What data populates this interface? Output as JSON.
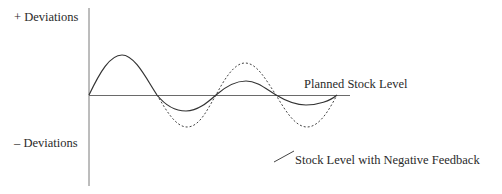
{
  "diagram": {
    "y_axis": {
      "top_label": "+ Deviations",
      "bottom_label": "– Deviations"
    },
    "baseline_label": "Planned Stock Level",
    "legend": {
      "solid_line_label": "Stock Level with Negative Feedback"
    },
    "series": [
      {
        "name": "Stock Level with Negative Feedback",
        "style": "solid",
        "description": "damped oscillation around planned stock level"
      },
      {
        "name": "Stock Level without feedback",
        "style": "dashed",
        "description": "amplifying oscillation around planned stock level"
      }
    ],
    "colors": {
      "line": "#3a3a3a",
      "axis": "#707070",
      "background": "#ffffff"
    }
  }
}
